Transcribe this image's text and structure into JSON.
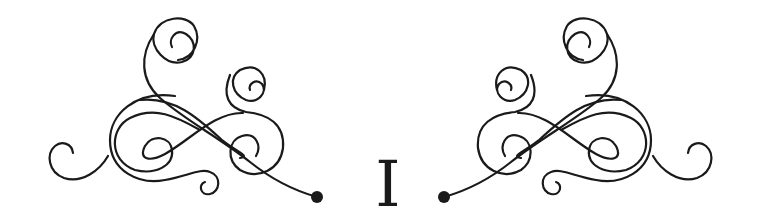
{
  "heading": {
    "numeral": "I"
  },
  "ornaments": {
    "left": "flourish-left",
    "right": "flourish-right",
    "stroke_color": "#1a1a1a",
    "background": "#ffffff"
  }
}
